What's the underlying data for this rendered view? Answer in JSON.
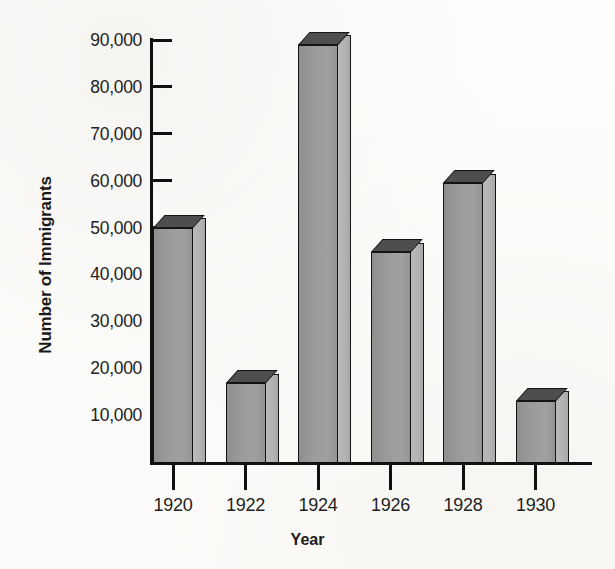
{
  "chart_data": {
    "type": "bar",
    "title": "",
    "xlabel": "Year",
    "ylabel": "Number of Immigrants",
    "categories": [
      "1920",
      "1922",
      "1924",
      "1926",
      "1928",
      "1930"
    ],
    "values": [
      50000,
      16800,
      89000,
      44700,
      59500,
      13100
    ],
    "ytick_labels": [
      "90,000",
      "80,000",
      "70,000",
      "60,000",
      "50,000",
      "40,000",
      "30,000",
      "20,000",
      "10,000"
    ],
    "ytick_values": [
      90000,
      80000,
      70000,
      60000,
      50000,
      40000,
      30000,
      20000,
      10000
    ],
    "ylim": [
      0,
      92000
    ],
    "grid": false,
    "legend": null,
    "style": "3d-bar",
    "colors": {
      "bar_front": "#9a9a9a",
      "bar_side": "#b4b4b4",
      "bar_top": "#4e4e4e",
      "axis": "#101010",
      "text": "#1f1f1f",
      "background": "#fdfdfc"
    }
  }
}
